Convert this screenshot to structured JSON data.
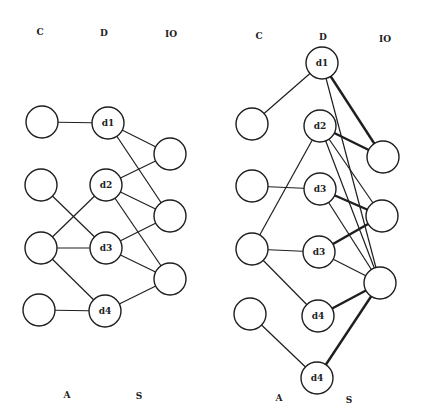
{
  "diagrams": [
    {
      "name": "left",
      "column_labels": [
        {
          "text": "C",
          "x": 40,
          "y": 32
        },
        {
          "text": "D",
          "x": 104,
          "y": 33
        },
        {
          "text": "IO",
          "x": 171,
          "y": 34
        }
      ],
      "bottom_labels": [
        {
          "text": "A",
          "x": 67,
          "y": 395
        },
        {
          "text": "S",
          "x": 139,
          "y": 396
        }
      ],
      "nodes": [
        {
          "id": "c1",
          "label": "",
          "x": 42,
          "y": 122
        },
        {
          "id": "c2",
          "label": "",
          "x": 41,
          "y": 185
        },
        {
          "id": "c3",
          "label": "",
          "x": 41,
          "y": 248
        },
        {
          "id": "c4",
          "label": "",
          "x": 39,
          "y": 310
        },
        {
          "id": "d1",
          "label": "d1",
          "x": 108,
          "y": 123
        },
        {
          "id": "d2",
          "label": "d2",
          "x": 106,
          "y": 185
        },
        {
          "id": "d3",
          "label": "d3",
          "x": 106,
          "y": 248
        },
        {
          "id": "d4",
          "label": "d4",
          "x": 105,
          "y": 311
        },
        {
          "id": "io1",
          "label": "",
          "x": 170,
          "y": 154
        },
        {
          "id": "io2",
          "label": "",
          "x": 170,
          "y": 216
        },
        {
          "id": "io3",
          "label": "",
          "x": 170,
          "y": 279
        }
      ],
      "edges": [
        {
          "from": "c1",
          "to": "d1",
          "bold": false
        },
        {
          "from": "c2",
          "to": "d3",
          "bold": false
        },
        {
          "from": "c3",
          "to": "d2",
          "bold": false
        },
        {
          "from": "c3",
          "to": "d3",
          "bold": false
        },
        {
          "from": "c3",
          "to": "d4",
          "bold": false
        },
        {
          "from": "c4",
          "to": "d4",
          "bold": false
        },
        {
          "from": "d1",
          "to": "io1",
          "bold": false
        },
        {
          "from": "d1",
          "to": "io2",
          "bold": false
        },
        {
          "from": "d2",
          "to": "io1",
          "bold": false
        },
        {
          "from": "d2",
          "to": "io2",
          "bold": false
        },
        {
          "from": "d2",
          "to": "io3",
          "bold": false
        },
        {
          "from": "d3",
          "to": "io2",
          "bold": false
        },
        {
          "from": "d3",
          "to": "io3",
          "bold": false
        },
        {
          "from": "d4",
          "to": "io3",
          "bold": false
        }
      ]
    },
    {
      "name": "right",
      "column_labels": [
        {
          "text": "C",
          "x": 259,
          "y": 36
        },
        {
          "text": "D",
          "x": 323,
          "y": 37
        },
        {
          "text": "IO",
          "x": 385,
          "y": 39
        }
      ],
      "bottom_labels": [
        {
          "text": "A",
          "x": 279,
          "y": 398
        },
        {
          "text": "S",
          "x": 349,
          "y": 400
        }
      ],
      "nodes": [
        {
          "id": "c1",
          "label": "",
          "x": 252,
          "y": 124
        },
        {
          "id": "c2",
          "label": "",
          "x": 252,
          "y": 186
        },
        {
          "id": "c3",
          "label": "",
          "x": 252,
          "y": 249
        },
        {
          "id": "c4",
          "label": "",
          "x": 250,
          "y": 314
        },
        {
          "id": "d1",
          "label": "d1",
          "x": 322,
          "y": 63
        },
        {
          "id": "d2",
          "label": "d2",
          "x": 320,
          "y": 126
        },
        {
          "id": "d3a",
          "label": "d3",
          "x": 320,
          "y": 189
        },
        {
          "id": "d3b",
          "label": "d3",
          "x": 319,
          "y": 252
        },
        {
          "id": "d4a",
          "label": "d4",
          "x": 318,
          "y": 316
        },
        {
          "id": "d4b",
          "label": "d4",
          "x": 317,
          "y": 378
        },
        {
          "id": "io1",
          "label": "",
          "x": 383,
          "y": 157
        },
        {
          "id": "io2",
          "label": "",
          "x": 382,
          "y": 216
        },
        {
          "id": "io3",
          "label": "",
          "x": 380,
          "y": 283
        }
      ],
      "edges": [
        {
          "from": "c1",
          "to": "d1",
          "bold": false
        },
        {
          "from": "c2",
          "to": "d3a",
          "bold": false
        },
        {
          "from": "c3",
          "to": "d2",
          "bold": false
        },
        {
          "from": "c3",
          "to": "d3b",
          "bold": false
        },
        {
          "from": "c3",
          "to": "d4a",
          "bold": false
        },
        {
          "from": "c4",
          "to": "d4b",
          "bold": false
        },
        {
          "from": "d1",
          "to": "io1",
          "bold": true
        },
        {
          "from": "d1",
          "to": "io3",
          "bold": false
        },
        {
          "from": "d2",
          "to": "io1",
          "bold": true
        },
        {
          "from": "d2",
          "to": "io2",
          "bold": false
        },
        {
          "from": "d2",
          "to": "io3",
          "bold": false
        },
        {
          "from": "d3a",
          "to": "io2",
          "bold": true
        },
        {
          "from": "d3a",
          "to": "io3",
          "bold": false
        },
        {
          "from": "d3b",
          "to": "io2",
          "bold": true
        },
        {
          "from": "d3b",
          "to": "io3",
          "bold": false
        },
        {
          "from": "d4a",
          "to": "io3",
          "bold": true
        },
        {
          "from": "d4b",
          "to": "io3",
          "bold": true
        }
      ]
    }
  ],
  "style": {
    "line_color": "#1e1e1e",
    "background": "#ffffff",
    "node_radius": 16
  }
}
